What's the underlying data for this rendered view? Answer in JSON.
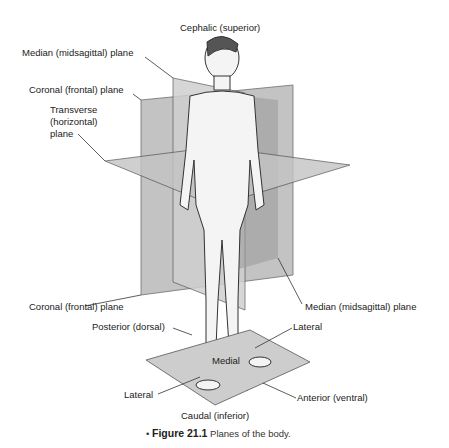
{
  "figure": {
    "labels": {
      "cephalic": "Cephalic (superior)",
      "median_top": "Median (midsagittal) plane",
      "coronal_top": "Coronal (frontal) plane",
      "transverse_1": "Transverse",
      "transverse_2": "(horizontal)",
      "transverse_3": "plane",
      "coronal_bottom": "Coronal (frontal) plane",
      "median_bottom": "Median (midsagittal) plane",
      "posterior": "Posterior (dorsal)",
      "lateral_right": "Lateral",
      "medial": "Medial",
      "lateral_left": "Lateral",
      "anterior": "Anterior (ventral)",
      "caudal": "Caudal (inferior)"
    },
    "caption": {
      "bullet": "•",
      "number": "Figure 21.1",
      "text": "Planes of the body."
    },
    "colors": {
      "plane_light": "#d6d6d6",
      "plane_mid": "#a9a9a9",
      "plane_dark": "#8a8a8a",
      "line": "#333333"
    }
  }
}
